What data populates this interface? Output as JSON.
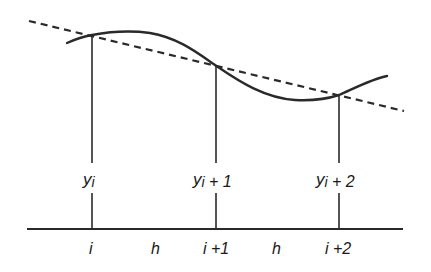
{
  "diagram": {
    "colors": {
      "stroke": "#2a2a2a",
      "background": "#ffffff"
    },
    "node_labels": [
      {
        "id": "yi",
        "base": "y",
        "sub": "i",
        "suffix": ""
      },
      {
        "id": "yi1",
        "base": "y",
        "sub": "i",
        "suffix": " + 1"
      },
      {
        "id": "yi2",
        "base": "y",
        "sub": "i",
        "suffix": " + 2"
      }
    ],
    "axis_labels": [
      {
        "id": "i",
        "text": "i"
      },
      {
        "id": "h1",
        "text": "h"
      },
      {
        "id": "i1",
        "text": "i +1"
      },
      {
        "id": "h2",
        "text": "h"
      },
      {
        "id": "i2",
        "text": "i +2"
      }
    ]
  }
}
